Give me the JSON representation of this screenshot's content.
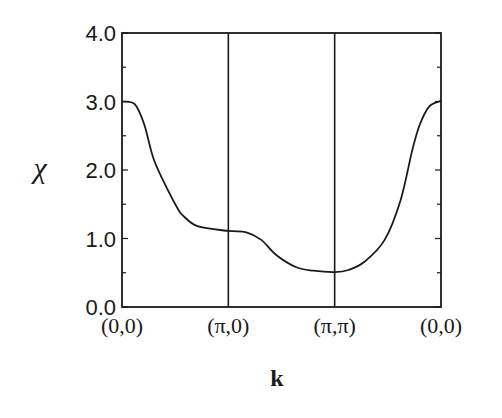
{
  "chart_data": {
    "type": "line",
    "title": "",
    "xlabel": "k",
    "ylabel": "χ",
    "ylim": [
      0.0,
      4.0
    ],
    "yticks": [
      0.0,
      1.0,
      2.0,
      3.0,
      4.0
    ],
    "ytick_labels": [
      "0.0",
      "1.0",
      "2.0",
      "3.0",
      "4.0"
    ],
    "y_minor_tick_step": 0.5,
    "x_categories": [
      "(0,0)",
      "(π,0)",
      "(π,π)",
      "(0,0)"
    ],
    "x_category_positions": [
      0.0,
      1.0,
      2.0,
      3.0
    ],
    "vertical_lines_at": [
      1.0,
      2.0
    ],
    "grid": false,
    "legend": null,
    "series": [
      {
        "name": "χ(k)",
        "color": "#1a1a1a",
        "x": [
          0.0,
          0.12,
          0.21,
          0.3,
          0.44,
          0.53,
          0.57,
          0.71,
          1.0,
          1.17,
          1.31,
          1.45,
          1.64,
          1.8,
          2.0,
          2.13,
          2.28,
          2.47,
          2.62,
          2.73,
          2.8,
          2.89,
          3.0
        ],
        "values": [
          3.0,
          2.96,
          2.66,
          2.15,
          1.68,
          1.42,
          1.34,
          1.18,
          1.11,
          1.09,
          0.98,
          0.76,
          0.58,
          0.53,
          0.51,
          0.54,
          0.66,
          0.98,
          1.56,
          2.29,
          2.66,
          2.93,
          3.01
        ]
      }
    ]
  },
  "labels": {
    "y_axis": "χ",
    "x_axis": "k",
    "x_ticks": [
      "(0,0)",
      "(π,0)",
      "(π,π)",
      "(0,0)"
    ],
    "y_ticks": [
      "0.0",
      "1.0",
      "2.0",
      "3.0",
      "4.0"
    ]
  }
}
